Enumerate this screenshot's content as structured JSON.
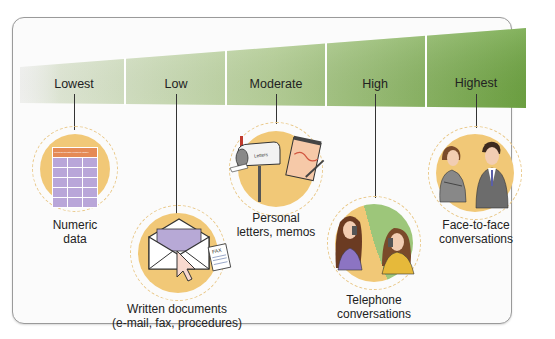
{
  "diagram": {
    "title_hidden": "",
    "scale": {
      "levels": [
        {
          "label": "Lowest",
          "x": 74
        },
        {
          "label": "Low",
          "x": 176
        },
        {
          "label": "Moderate",
          "x": 276
        },
        {
          "label": "High",
          "x": 375
        },
        {
          "label": "Highest",
          "x": 476
        }
      ],
      "colors": {
        "start": "#e9f0de",
        "end": "#6fa542"
      }
    },
    "channels": [
      {
        "id": "numeric",
        "line1": "Numeric",
        "line2": "data",
        "icon": "data-table-icon"
      },
      {
        "id": "written",
        "line1": "Written documents",
        "line2": "(e-mail, fax, procedures)",
        "icon": "envelope-fax-icon"
      },
      {
        "id": "personal",
        "line1": "Personal",
        "line2": "letters, memos",
        "icon": "mailbox-notepad-icon"
      },
      {
        "id": "telephone",
        "line1": "Telephone",
        "line2": "conversations",
        "icon": "telephone-people-icon"
      },
      {
        "id": "face",
        "line1": "Face-to-face",
        "line2": "conversations",
        "icon": "two-people-talking-icon"
      }
    ],
    "gdp_table": {
      "title": "Gross Domestic Product (GDP)",
      "col_headers": [
        "",
        "",
        ""
      ],
      "rows": [
        [
          "US",
          "",
          ""
        ],
        [
          "Canada",
          "",
          ""
        ],
        [
          "Germany",
          "",
          ""
        ],
        [
          "UK",
          "",
          ""
        ]
      ]
    },
    "mailbox_label": "Letters",
    "fax_label": "FAX",
    "accent_circle": "#f1c877",
    "accent_dash": "#e9c889"
  }
}
